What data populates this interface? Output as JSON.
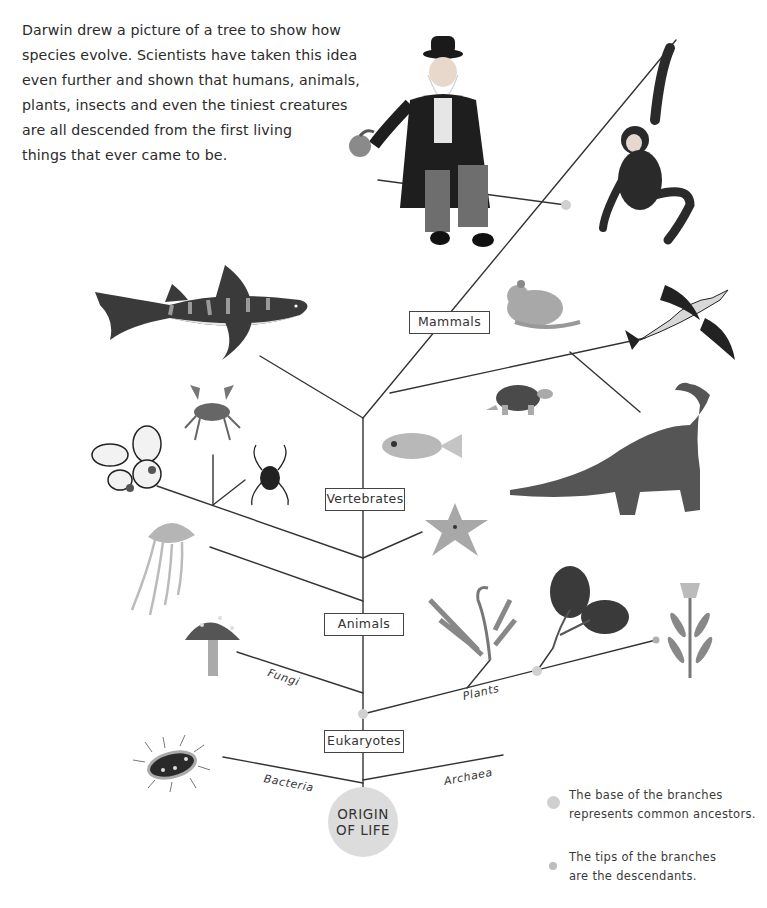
{
  "intro": {
    "lines": [
      "Darwin drew a picture of a tree to show how",
      "species evolve. Scientists have taken this idea",
      "even further and shown that humans, animals,",
      "plants, insects and even the tiniest creatures",
      "are all descended from the first living",
      "things that ever came to be."
    ]
  },
  "tree": {
    "node_labels": {
      "mammals": "Mammals",
      "vertebrates": "Vertebrates",
      "animals": "Animals",
      "eukaryotes": "Eukaryotes"
    },
    "branch_labels": {
      "fungi": "Fungi",
      "plants": "Plants",
      "bacteria": "Bacteria",
      "archaea": "Archaea"
    },
    "root": {
      "line1": "ORIGIN",
      "line2": "OF LIFE"
    },
    "illustrations": [
      "darwin",
      "monkey",
      "shark",
      "mouse",
      "bird",
      "turtle",
      "fish",
      "dinosaur",
      "crab",
      "butterfly",
      "spider",
      "starfish",
      "jellyfish",
      "mushroom",
      "fern",
      "oak-leaves",
      "flower",
      "bacterium"
    ]
  },
  "legend": {
    "base": {
      "line1": "The base of the branches",
      "line2": "represents common ancestors."
    },
    "tips": {
      "line1": "The tips of the branches",
      "line2": "are the descendants."
    }
  },
  "colors": {
    "line": "#333333",
    "ancestor_dot": "#cfcfcf",
    "tip_dot": "#bdbdbd",
    "origin_circle": "#dcdcdc"
  }
}
